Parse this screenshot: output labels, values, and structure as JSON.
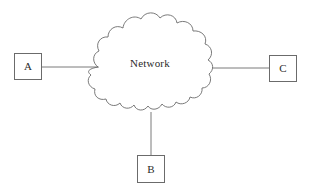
{
  "diagram": {
    "background_color": "#ffffff",
    "stroke_color": "#6b6b6b",
    "text_color": "#2b2b2b",
    "cloud": {
      "label": "Network",
      "shape": "scalloped-cloud",
      "center_x": 150,
      "center_y": 65
    },
    "nodes": [
      {
        "id": "a",
        "label": "A",
        "x": 14,
        "y": 53,
        "width": 28,
        "height": 27,
        "position": "left"
      },
      {
        "id": "b",
        "label": "B",
        "x": 137,
        "y": 155,
        "width": 28,
        "height": 28,
        "position": "bottom"
      },
      {
        "id": "c",
        "label": "C",
        "x": 269,
        "y": 55,
        "width": 28,
        "height": 27,
        "position": "right"
      }
    ],
    "links": [
      {
        "id": "a-cloud",
        "from": "a",
        "to": "cloud",
        "x1": 42,
        "y1": 67,
        "x2": 98,
        "y2": 67
      },
      {
        "id": "cloud-c",
        "from": "cloud",
        "to": "c",
        "x1": 212,
        "y1": 68,
        "x2": 269,
        "y2": 68
      },
      {
        "id": "cloud-b",
        "from": "cloud",
        "to": "b",
        "x1": 151,
        "y1": 113,
        "x2": 151,
        "y2": 155
      }
    ]
  }
}
